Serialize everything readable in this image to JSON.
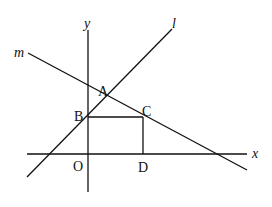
{
  "diagram": {
    "type": "coordinate-geometry",
    "axes": {
      "x_label": "x",
      "y_label": "y",
      "origin_label": "O"
    },
    "lines": [
      {
        "name": "l",
        "label": "l"
      },
      {
        "name": "m",
        "label": "m"
      }
    ],
    "points": [
      {
        "name": "A",
        "label": "A"
      },
      {
        "name": "B",
        "label": "B"
      },
      {
        "name": "C",
        "label": "C"
      },
      {
        "name": "D",
        "label": "D"
      }
    ],
    "colors": {
      "stroke": "#111111",
      "background": "#ffffff"
    }
  }
}
